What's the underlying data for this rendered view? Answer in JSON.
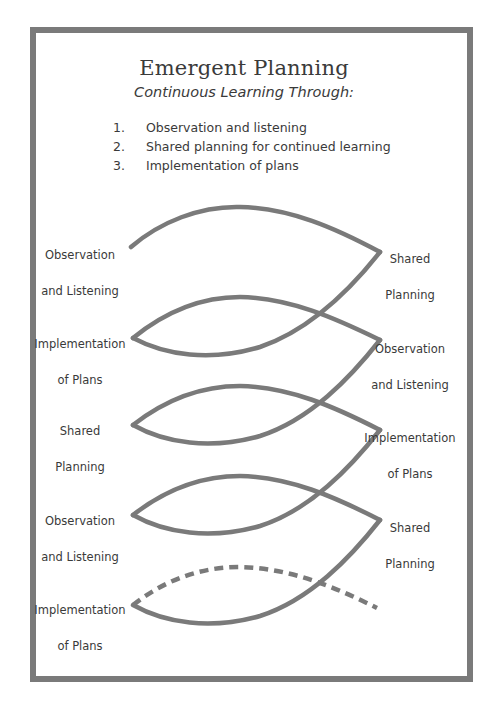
{
  "title": "Emergent Planning",
  "subtitle": "Continuous Learning Through:",
  "steps": [
    {
      "num": "1.",
      "text": "Observation and listening"
    },
    {
      "num": "2.",
      "text": "Shared planning for continued learning"
    },
    {
      "num": "3.",
      "text": "Implementation of plans"
    }
  ],
  "cycle_labels": {
    "left": [
      {
        "line1": "Observation",
        "line2": "and Listening"
      },
      {
        "line1": "Implementation",
        "line2": "of Plans"
      },
      {
        "line1": "Shared",
        "line2": "Planning"
      },
      {
        "line1": "Observation",
        "line2": "and Listening"
      },
      {
        "line1": "Implementation",
        "line2": "of Plans"
      }
    ],
    "right": [
      {
        "line1": "Shared",
        "line2": "Planning"
      },
      {
        "line1": "Observation",
        "line2": "and Listening"
      },
      {
        "line1": "Implementation",
        "line2": "of Plans"
      },
      {
        "line1": "Shared",
        "line2": "Planning"
      }
    ]
  },
  "colors": {
    "stroke": "#7a7a7a",
    "frame": "#7a7a7a",
    "text": "#3a3a3a"
  }
}
